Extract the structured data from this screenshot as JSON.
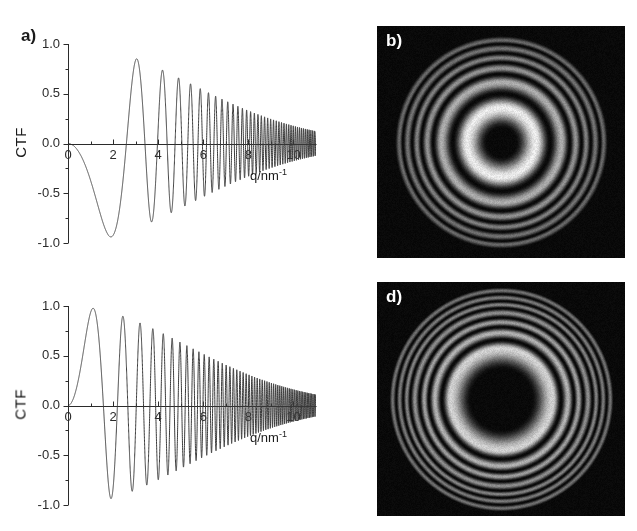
{
  "figure": {
    "background": "#ffffff",
    "width": 637,
    "height": 531
  },
  "panels": {
    "a": {
      "tag": "a)",
      "kind": "plot"
    },
    "b": {
      "tag": "b)",
      "kind": "power-spectrum"
    },
    "c": {
      "tag": "c)",
      "kind": "plot"
    },
    "d": {
      "tag": "d)",
      "kind": "power-spectrum"
    }
  },
  "chart_data": [
    {
      "id": "panel-a",
      "panel": "a",
      "type": "line",
      "title": "",
      "xlabel": "q/nm⁻¹",
      "ylabel": "CTF",
      "xlim": [
        0,
        11.0
      ],
      "ylim": [
        -1.0,
        1.0
      ],
      "xticks": [
        0,
        2,
        4,
        6,
        8,
        10
      ],
      "xticklabels": [
        "0",
        "2",
        "4",
        "6",
        "8",
        "10"
      ],
      "yticks": [
        -1.0,
        -0.5,
        0.0,
        0.5,
        1.0
      ],
      "yticklabels": [
        "-1.0",
        "-0.5",
        "0.0",
        "0.5",
        "1.0"
      ],
      "minor_xticks_per_interval": 2,
      "minor_yticks_per_interval": 2,
      "grid": false,
      "legend": null,
      "line_color": "#3a3a3a",
      "line_width": 1.0,
      "zero_axis": true,
      "model": {
        "name": "ctf-scherzer-underfocus",
        "formula": "CTF(q) = -sin(pi/2 * (Cs*lambda^3*q^4 - 2*dz*lambda*q^2)) * exp(-(q/q_env)^2)",
        "Cs_mm": 1.2,
        "lambda_nm": 0.00197,
        "defocus_nm": -60,
        "envelope_q": 7.6,
        "sign": 1
      },
      "features": {
        "first_zero_crossing": 4.0,
        "first_max": {
          "x": 3.2,
          "y": 0.92
        },
        "first_min": {
          "x": 4.25,
          "y": -0.85
        },
        "second_max": {
          "x": 4.9,
          "y": 0.7
        },
        "second_min": {
          "x": 5.35,
          "y": -0.63
        },
        "third_max": {
          "x": 5.75,
          "y": 0.55
        },
        "damping_end": 9.6
      }
    },
    {
      "id": "panel-c",
      "panel": "c",
      "type": "line",
      "title": "",
      "xlabel": "q/nm⁻¹",
      "ylabel": "CTF",
      "xlim": [
        0,
        11.0
      ],
      "ylim": [
        -1.0,
        1.0
      ],
      "xticks": [
        0,
        2,
        4,
        6,
        8,
        10
      ],
      "xticklabels": [
        "0",
        "2",
        "4",
        "6",
        "8",
        "10"
      ],
      "yticks": [
        -1.0,
        -0.5,
        0.0,
        0.5,
        1.0
      ],
      "yticklabels": [
        "-1.0",
        "-0.5",
        "0.0",
        "0.5",
        "1.0"
      ],
      "minor_xticks_per_interval": 2,
      "minor_yticks_per_interval": 2,
      "grid": false,
      "legend": null,
      "line_color": "#3a3a3a",
      "line_width": 1.0,
      "zero_axis": true,
      "model": {
        "name": "ctf-large-underfocus",
        "formula": "CTF(q) = sin(pi/2 * (Cs*lambda^3*q^4 - 2*dz*lambda*q^2)) * exp(-(q/q_env)^2)",
        "Cs_mm": 1.2,
        "lambda_nm": 0.00197,
        "defocus_nm": -200,
        "envelope_q": 7.4,
        "sign": -1
      },
      "features": {
        "first_min": {
          "x": 2.3,
          "y": -1.0
        },
        "local_max_negative": {
          "x": 3.5,
          "y": -0.72
        },
        "local_min_negative": {
          "x": 4.3,
          "y": -0.8
        },
        "first_zero_crossing": 5.0,
        "first_positive_max": {
          "x": 5.4,
          "y": 0.59
        },
        "second_min": {
          "x": 5.9,
          "y": -0.51
        },
        "second_max": {
          "x": 6.35,
          "y": 0.38
        },
        "damping_end": 9.5
      }
    },
    {
      "id": "panel-b",
      "panel": "b",
      "type": "heatmap",
      "title": "",
      "description": "Radially symmetric Thon-ring power spectrum, CTF² of panel a",
      "colormap": "grayscale",
      "background": "#050505",
      "rings": {
        "center_dark_radius": 0.16,
        "first_bright_ring_radius": 0.3,
        "bright_ring_peaks": [
          0.3,
          0.52,
          0.64,
          0.73,
          0.81,
          0.88
        ],
        "dark_ring_radii": [
          0.0,
          0.42,
          0.59,
          0.69,
          0.77,
          0.85,
          0.92
        ],
        "intensity_falloff": 0.55
      }
    },
    {
      "id": "panel-d",
      "panel": "d",
      "type": "heatmap",
      "title": "",
      "description": "Radially symmetric Thon-ring power spectrum, CTF² of panel c",
      "colormap": "grayscale",
      "background": "#050505",
      "rings": {
        "center_dark_radius": 0.34,
        "first_bright_ring_radius": 0.44,
        "bright_ring_peaks": [
          0.44,
          0.57,
          0.66,
          0.74,
          0.81,
          0.87,
          0.93
        ],
        "dark_ring_radii": [
          0.0,
          0.51,
          0.62,
          0.7,
          0.78,
          0.84,
          0.9,
          0.96
        ],
        "intensity_falloff": 0.62
      }
    }
  ]
}
